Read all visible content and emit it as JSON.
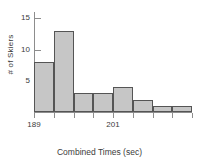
{
  "chart_data": {
    "type": "bar",
    "title": "",
    "xlabel": "Combined Times (sec)",
    "ylabel": "# of Skiers",
    "categories": [
      "189-192",
      "192-195",
      "195-198",
      "198-201",
      "201-204",
      "204-207",
      "207-210",
      "210-213"
    ],
    "values": [
      8,
      13,
      3,
      3,
      4,
      2,
      1,
      1
    ],
    "bin_edges": [
      189,
      192,
      195,
      198,
      201,
      204,
      207,
      210,
      213
    ],
    "xlim": [
      189,
      213
    ],
    "ylim": [
      0,
      16
    ],
    "x_tick_labels": [
      "189",
      "201"
    ],
    "x_tick_values": [
      189,
      201
    ],
    "y_tick_labels": [
      "5",
      "10",
      "15"
    ],
    "y_tick_values": [
      5,
      10,
      15
    ],
    "grid": false,
    "legend": false,
    "colors": {
      "bar_fill": "#c6c6c6",
      "bar_edge": "#555555",
      "axis": "#8d8d8d",
      "text": "#3b3b3b",
      "background": "#ffffff"
    }
  }
}
